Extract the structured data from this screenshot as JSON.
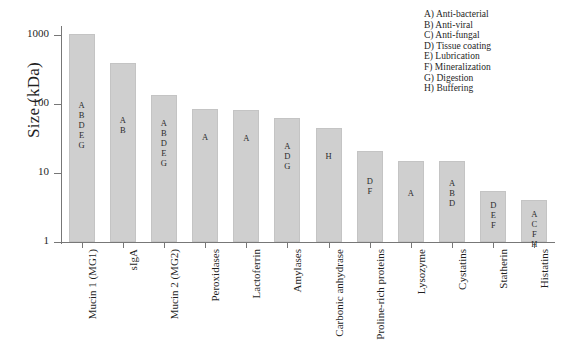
{
  "chart_data": {
    "type": "bar",
    "title": "",
    "subtitle": "",
    "xlabel": "",
    "ylabel": "Size (kDa)",
    "yscale": "log",
    "ylim": [
      1,
      1400
    ],
    "ytick_labels": [
      "1",
      "10",
      "100",
      "1000"
    ],
    "ytick_values": [
      1,
      10,
      100,
      1000
    ],
    "grid": false,
    "legend_position": "top-right",
    "categories": [
      "Mucin 1 (MG1)",
      "sIgA",
      "Mucin 2 (MG2)",
      "Peroxidases",
      "Lactoferrin",
      "Amylases",
      "Carbonic anhydrase",
      "Proline-rich proteins",
      "Lysozyme",
      "Cystatins",
      "Statherin",
      "Histatins"
    ],
    "values": [
      1050,
      400,
      135,
      85,
      83,
      62,
      45,
      21,
      15,
      15,
      5.5,
      4.0
    ],
    "bar_annotations": [
      [
        "A",
        "B",
        "D",
        "E",
        "G"
      ],
      [
        "A",
        "B"
      ],
      [
        "A",
        "B",
        "D",
        "E",
        "G"
      ],
      [
        "A"
      ],
      [
        "A"
      ],
      [
        "A",
        "D",
        "G"
      ],
      [
        "H"
      ],
      [
        "D",
        "F"
      ],
      [
        "A"
      ],
      [
        "A",
        "B",
        "D"
      ],
      [
        "D",
        "E",
        "F"
      ],
      [
        "A",
        "C",
        "F",
        "H"
      ]
    ],
    "bar_color": "#cfcfcf",
    "axis_color": "#777777"
  },
  "legend": {
    "items": [
      "A) Anti-bacterial",
      "B) Anti-viral",
      "C) Anti-fungal",
      "D) Tissue coating",
      "E) Lubrication",
      "F) Mineralization",
      "G) Digestion",
      "H) Buffering"
    ]
  }
}
